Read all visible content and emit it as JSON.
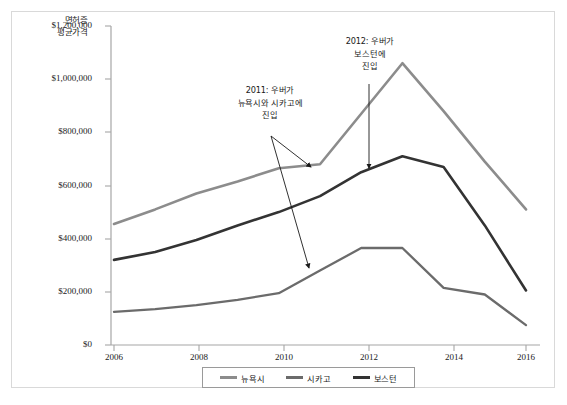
{
  "chart_data": {
    "type": "line",
    "title": "",
    "ylabel": "면허증 평균가격",
    "xlabel": "",
    "x": [
      2006,
      2007,
      2008,
      2009,
      2010,
      2011,
      2012,
      2013,
      2014,
      2015,
      2016
    ],
    "xlim": [
      2006,
      2016
    ],
    "ylim": [
      0,
      1200000
    ],
    "ytick_labels": [
      "$1,200,000",
      "$1,000,000",
      "$800,000",
      "$600,000",
      "$400,000",
      "$200,000",
      "$0"
    ],
    "ytick_values": [
      1200000,
      1000000,
      800000,
      600000,
      400000,
      200000,
      0
    ],
    "xtick_labels": [
      "2006",
      "2008",
      "2010",
      "2012",
      "2014",
      "2016"
    ],
    "xtick_values": [
      2006,
      2008,
      2010,
      2012,
      2014,
      2016
    ],
    "grid": false,
    "legend_position": "bottom",
    "series": [
      {
        "name": "뉴욕시",
        "color": "#8c8c8c",
        "values": [
          455000,
          510000,
          570000,
          615000,
          665000,
          680000,
          870000,
          1060000,
          880000,
          690000,
          510000
        ]
      },
      {
        "name": "시카고",
        "color": "#6b6b6b",
        "values": [
          125000,
          135000,
          150000,
          170000,
          195000,
          280000,
          365000,
          365000,
          215000,
          190000,
          75000
        ]
      },
      {
        "name": "보스턴",
        "color": "#333333",
        "values": [
          320000,
          350000,
          395000,
          450000,
          500000,
          560000,
          650000,
          710000,
          670000,
          450000,
          205000
        ]
      }
    ],
    "annotations": [
      {
        "id": "annotation-2011",
        "lines": [
          "2011: 우버가",
          "뉴욕시와 시카고에",
          "진입"
        ],
        "text": "2011: 우버가 뉴욕시와 시카고에 진입"
      },
      {
        "id": "annotation-2012",
        "lines": [
          "2012: 우버가",
          "보스턴에",
          "진입"
        ],
        "text": "2012: 우버가 보스턴에 진입"
      }
    ]
  },
  "axis": {
    "y_title_line1": "면허증",
    "y_title_line2": "평균가격"
  },
  "legend": {
    "items": [
      {
        "label": "뉴욕시",
        "color": "#8c8c8c"
      },
      {
        "label": "시카고",
        "color": "#6b6b6b"
      },
      {
        "label": "보스턴",
        "color": "#333333"
      }
    ]
  },
  "colors": {
    "new_york": "#8c8c8c",
    "chicago": "#6b6b6b",
    "boston": "#333333",
    "axis": "#a6a6a6",
    "text": "#1a1a1a",
    "frame": "#d9d9d9"
  }
}
